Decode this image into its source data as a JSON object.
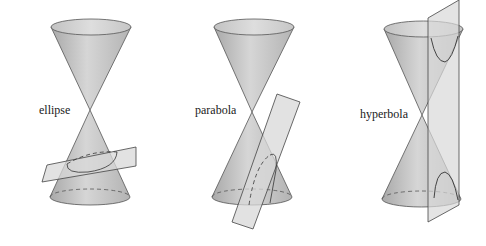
{
  "diagram": {
    "panels": [
      {
        "id": "ellipse",
        "label": "ellipse",
        "plane": "tilted, cuts one nappe completely"
      },
      {
        "id": "parabola",
        "label": "parabola",
        "plane": "parallel to cone side"
      },
      {
        "id": "hyperbola",
        "label": "hyperbola",
        "plane": "vertical, cuts both nappes"
      }
    ]
  },
  "colors": {
    "cone_fill": "#c9c9c9",
    "cone_edge": "#555555",
    "plane_fill": "#d8d8d8",
    "curve": "#333333",
    "background": "#ffffff"
  }
}
